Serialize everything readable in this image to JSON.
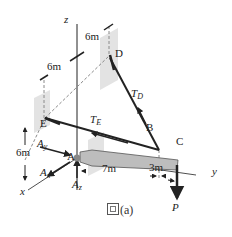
{
  "figure": {
    "caption_prefix": "圖",
    "caption_suffix": "(a)",
    "axes": {
      "x": "x",
      "y": "y",
      "z": "z"
    },
    "points": {
      "A": "A",
      "B": "B",
      "C": "C",
      "D": "D",
      "E": "E"
    },
    "dimensions": {
      "top_right": "6m",
      "top_left": "6m",
      "left_vertical": "6m",
      "AB": "7m",
      "BC": "3m"
    },
    "forces": {
      "TD": {
        "main": "T",
        "sub": "D"
      },
      "TE": {
        "main": "T",
        "sub": "E"
      },
      "Ax": {
        "main": "A",
        "sub": "x"
      },
      "Ay": {
        "main": "A",
        "sub": "y"
      },
      "Az": {
        "main": "A",
        "sub": "z"
      },
      "P": "P"
    },
    "colors": {
      "line": "#222222",
      "beam": "#bdbdbd",
      "dashed": "#8a8a8a",
      "shade": "#e3e3e3"
    }
  }
}
